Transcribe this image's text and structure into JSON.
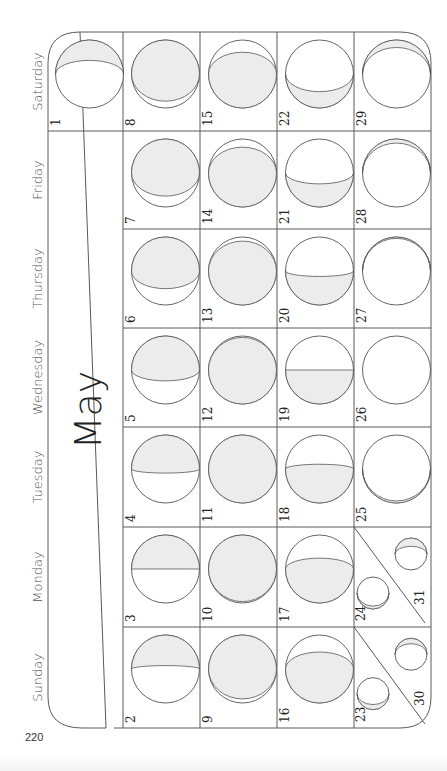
{
  "page": {
    "page_number": "220",
    "month": "May"
  },
  "weekdays": [
    "Saturday",
    "Friday",
    "Thursday",
    "Wednesday",
    "Tuesday",
    "Monday",
    "Sunday"
  ],
  "colors": {
    "lit": "#ececec",
    "line": "#555555",
    "background": "#ffffff"
  },
  "days": [
    {
      "day": "1",
      "weekday": "Saturday",
      "week": 0,
      "lit": 0.3,
      "side": "top"
    },
    {
      "day": "2",
      "weekday": "Sunday",
      "week": 0,
      "lit": 0.45,
      "side": "top"
    },
    {
      "day": "3",
      "weekday": "Monday",
      "week": 0,
      "lit": 0.5,
      "side": "top"
    },
    {
      "day": "4",
      "weekday": "Tuesday",
      "week": 0,
      "lit": 0.56,
      "side": "top"
    },
    {
      "day": "5",
      "weekday": "Wednesday",
      "week": 0,
      "lit": 0.66,
      "side": "top"
    },
    {
      "day": "6",
      "weekday": "Thursday",
      "week": 0,
      "lit": 0.76,
      "side": "top"
    },
    {
      "day": "7",
      "weekday": "Friday",
      "week": 0,
      "lit": 0.84,
      "side": "top"
    },
    {
      "day": "8",
      "weekday": "Saturday",
      "week": 1,
      "lit": 0.9,
      "side": "top"
    },
    {
      "day": "9",
      "weekday": "Sunday",
      "week": 1,
      "lit": 0.94,
      "side": "top"
    },
    {
      "day": "10",
      "weekday": "Monday",
      "week": 1,
      "lit": 0.98,
      "side": "top"
    },
    {
      "day": "11",
      "weekday": "Tuesday",
      "week": 1,
      "lit": 1.0,
      "side": "top"
    },
    {
      "day": "12",
      "weekday": "Wednesday",
      "week": 1,
      "lit": 0.98,
      "side": "bottom"
    },
    {
      "day": "13",
      "weekday": "Thursday",
      "week": 1,
      "lit": 0.94,
      "side": "bottom"
    },
    {
      "day": "14",
      "weekday": "Friday",
      "week": 1,
      "lit": 0.88,
      "side": "bottom"
    },
    {
      "day": "15",
      "weekday": "Saturday",
      "week": 2,
      "lit": 0.82,
      "side": "bottom"
    },
    {
      "day": "16",
      "weekday": "Sunday",
      "week": 2,
      "lit": 0.75,
      "side": "bottom"
    },
    {
      "day": "17",
      "weekday": "Monday",
      "week": 2,
      "lit": 0.66,
      "side": "bottom"
    },
    {
      "day": "18",
      "weekday": "Tuesday",
      "week": 2,
      "lit": 0.57,
      "side": "bottom"
    },
    {
      "day": "19",
      "weekday": "Wednesday",
      "week": 2,
      "lit": 0.5,
      "side": "bottom"
    },
    {
      "day": "20",
      "weekday": "Thursday",
      "week": 2,
      "lit": 0.42,
      "side": "bottom"
    },
    {
      "day": "21",
      "weekday": "Friday",
      "week": 2,
      "lit": 0.34,
      "side": "bottom"
    },
    {
      "day": "22",
      "weekday": "Saturday",
      "week": 3,
      "lit": 0.24,
      "side": "bottom"
    },
    {
      "day": "23",
      "weekday": "Sunday",
      "week": 3,
      "lit": 0.16,
      "side": "bottom",
      "split": "lower"
    },
    {
      "day": "24",
      "weekday": "Monday",
      "week": 3,
      "lit": 0.09,
      "side": "bottom",
      "split": "lower"
    },
    {
      "day": "25",
      "weekday": "Tuesday",
      "week": 3,
      "lit": 0.03,
      "side": "bottom"
    },
    {
      "day": "26",
      "weekday": "Wednesday",
      "week": 3,
      "lit": 0.0,
      "side": "top"
    },
    {
      "day": "27",
      "weekday": "Thursday",
      "week": 3,
      "lit": 0.02,
      "side": "top"
    },
    {
      "day": "28",
      "weekday": "Friday",
      "week": 3,
      "lit": 0.06,
      "side": "top"
    },
    {
      "day": "29",
      "weekday": "Saturday",
      "week": 4,
      "lit": 0.11,
      "side": "top"
    },
    {
      "day": "30",
      "weekday": "Sunday",
      "week": 3,
      "lit": 0.17,
      "side": "top",
      "split": "upper"
    },
    {
      "day": "31",
      "weekday": "Monday",
      "week": 3,
      "lit": 0.26,
      "side": "top",
      "split": "upper"
    }
  ]
}
